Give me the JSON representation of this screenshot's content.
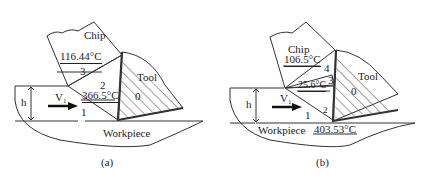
{
  "panels": [
    {
      "id": "a",
      "caption": "(a)",
      "chip_label": "Chip",
      "tool_label": "Tool",
      "workpiece_label": "Workpiece",
      "thickness_label": "h",
      "velocity_label": "V",
      "velocity_sub": "1",
      "zones": [
        "0",
        "1",
        "2",
        "3"
      ],
      "temperatures": [
        {
          "zone": "3",
          "value": "116.44°C"
        },
        {
          "zone": "2",
          "value": "366.5°C"
        }
      ]
    },
    {
      "id": "b",
      "caption": "(b)",
      "chip_label": "Chip",
      "tool_label": "Tool",
      "workpiece_label": "Workpiece",
      "thickness_label": "h",
      "velocity_label": "V",
      "velocity_sub": "1",
      "zones": [
        "0",
        "1",
        "2",
        "3",
        "4"
      ],
      "temperatures": [
        {
          "zone": "4",
          "value": "106.5°C"
        },
        {
          "zone": "3",
          "value": "25.6°C"
        },
        {
          "zone": "2",
          "value": "403.53°C"
        }
      ]
    }
  ]
}
